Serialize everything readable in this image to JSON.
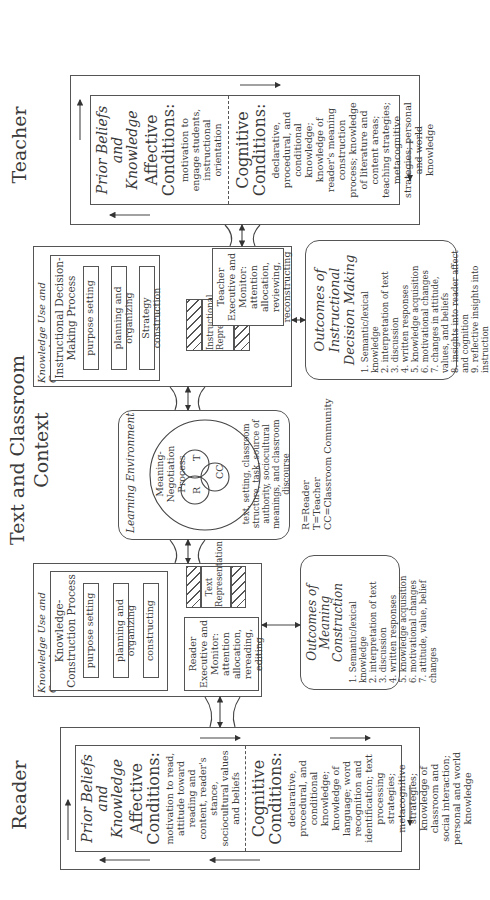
{
  "headings": {
    "reader": "Reader",
    "context": "Text and Classroom Context",
    "teacher": "Teacher"
  },
  "reader": {
    "prior_title": "Prior Beliefs and Knowledge",
    "affective_title": "Affective Conditions:",
    "affective_text": "motivation to read, attitude toward reading and content, reader's stance, sociocultural values and beliefs",
    "cognitive_title": "Cognitive Conditions:",
    "cognitive_text": "declarative, procedural, and conditional knowledge; knowledge of language; word recognition and identification; text processing strategies; metacognitive strategies; knowledge of classroom and social interaction; personal and world knowledge"
  },
  "reader_knowledge": {
    "label": "Knowledge Use and Control",
    "process_title": "Knowledge-Construction Process",
    "steps": [
      "purpose setting",
      "planning and organizing",
      "constructing"
    ],
    "executive": "Reader Executive and Monitor:",
    "executive_text": "attention allocation, rereading, editing",
    "representation": "Text Representation"
  },
  "reader_outcomes": {
    "title": "Outcomes of Meaning Construction",
    "items": [
      "1. Semantic/lexical knowledge",
      "2. interpretation of text",
      "3. discussion",
      "4. written responses",
      "5. knowledge acquisition",
      "6. motivational changes",
      "7. attitude, value, belief changes"
    ]
  },
  "environment": {
    "label": "Learning Environment",
    "process": "Meaning-Negotiation Process",
    "r": "R",
    "t": "T",
    "cc": "CC",
    "text": "text, setting, classroom structure, task, source of authority, sociocultural meanings, and classroom discourse"
  },
  "legend": {
    "lines": [
      "R=Reader",
      "T=Teacher",
      "CC=Classroom Community"
    ]
  },
  "teacher_knowledge": {
    "label": "Knowledge Use and Control",
    "process_title": "Instructional Decision-Making Process",
    "steps": [
      "purpose setting",
      "planning and organizing",
      "Strategy construction"
    ],
    "executive": "Teacher Executive and Monitor:",
    "executive_text": "attention allocation, reviewing, reconstructing",
    "representation": "Instructional Representation"
  },
  "teacher_outcomes": {
    "title": "Outcomes of Instructional Decision Making",
    "items": [
      "1. Semantic/lexical knowledge",
      "2. interpretation of text",
      "3. discussion",
      "4. written responses",
      "5. knowledge acquisition",
      "6. motivational changes",
      "7. changes in attitude, values, and beliefs",
      "8. insights into reader affect and cognition",
      "9. reflective insights into instruction"
    ]
  },
  "teacher": {
    "prior_title": "Prior Beliefs and Knowledge",
    "affective_title": "Affective Conditions:",
    "affective_text": "motivation to engage students, instructional orientation",
    "cognitive_title": "Cognitive Conditions:",
    "cognitive_text": "declarative, procedural, and conditional knowledge; knowledge of reader's meaning construction process; knowledge of literature and content areas; teaching strategies; metacognitive strategies; personal and world knowledge"
  }
}
